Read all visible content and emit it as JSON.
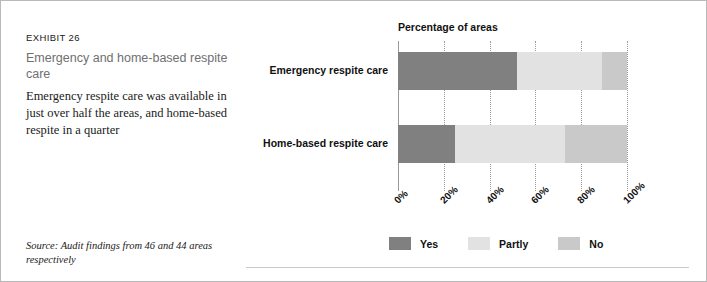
{
  "exhibit": {
    "number": "EXHIBIT 26",
    "title": "Emergency and home-based respite care",
    "description": "Emergency respite care was available in just over half the areas, and home-based respite in a quarter",
    "source": "Source: Audit findings from 46 and 44 areas respectively"
  },
  "legend": {
    "items": [
      {
        "label": "Yes",
        "color": "#808080"
      },
      {
        "label": "Partly",
        "color": "#e2e2e2"
      },
      {
        "label": "No",
        "color": "#c9c9c9"
      }
    ]
  },
  "colors": {
    "yes": "#808080",
    "partly": "#e2e2e2",
    "no": "#c9c9c9",
    "grid": "#9a9a9a",
    "title_grey": "#6f6f6f"
  },
  "chart_data": {
    "type": "bar",
    "orientation": "horizontal",
    "stacked": true,
    "title": "Percentage of areas",
    "xlabel": "",
    "ylabel": "",
    "xlim": [
      0,
      100
    ],
    "grid": true,
    "legend_position": "bottom",
    "categories": [
      "Emergency respite care",
      "Home-based respite care"
    ],
    "tick_labels": [
      "0%",
      "20%",
      "40%",
      "60%",
      "80%",
      "100%"
    ],
    "tick_values": [
      0,
      20,
      40,
      60,
      80,
      100
    ],
    "series": [
      {
        "name": "Yes",
        "values": [
          52,
          25
        ]
      },
      {
        "name": "Partly",
        "values": [
          37,
          48
        ]
      },
      {
        "name": "No",
        "values": [
          11,
          27
        ]
      }
    ]
  }
}
